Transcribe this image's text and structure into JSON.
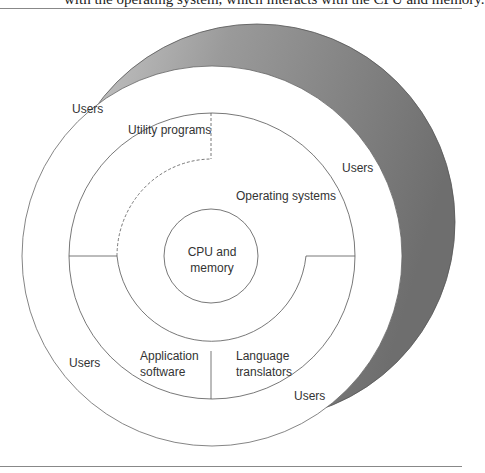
{
  "caption": "with the operating system, which interacts with the CPU and memory.",
  "diagram": {
    "layers": [
      {
        "name": "core",
        "label_line1": "CPU and",
        "label_line2": "memory"
      },
      {
        "name": "operating-systems",
        "label": "Operating systems"
      },
      {
        "name": "utility-programs",
        "label": "Utility programs"
      },
      {
        "name": "application-software",
        "label_line1": "Application",
        "label_line2": "software"
      },
      {
        "name": "language-translators",
        "label_line1": "Language",
        "label_line2": "translators"
      },
      {
        "name": "users",
        "labels": [
          "Users",
          "Users",
          "Users",
          "Users"
        ]
      }
    ],
    "colors": {
      "shade": "#7a7a7a",
      "line": "#555555"
    }
  }
}
